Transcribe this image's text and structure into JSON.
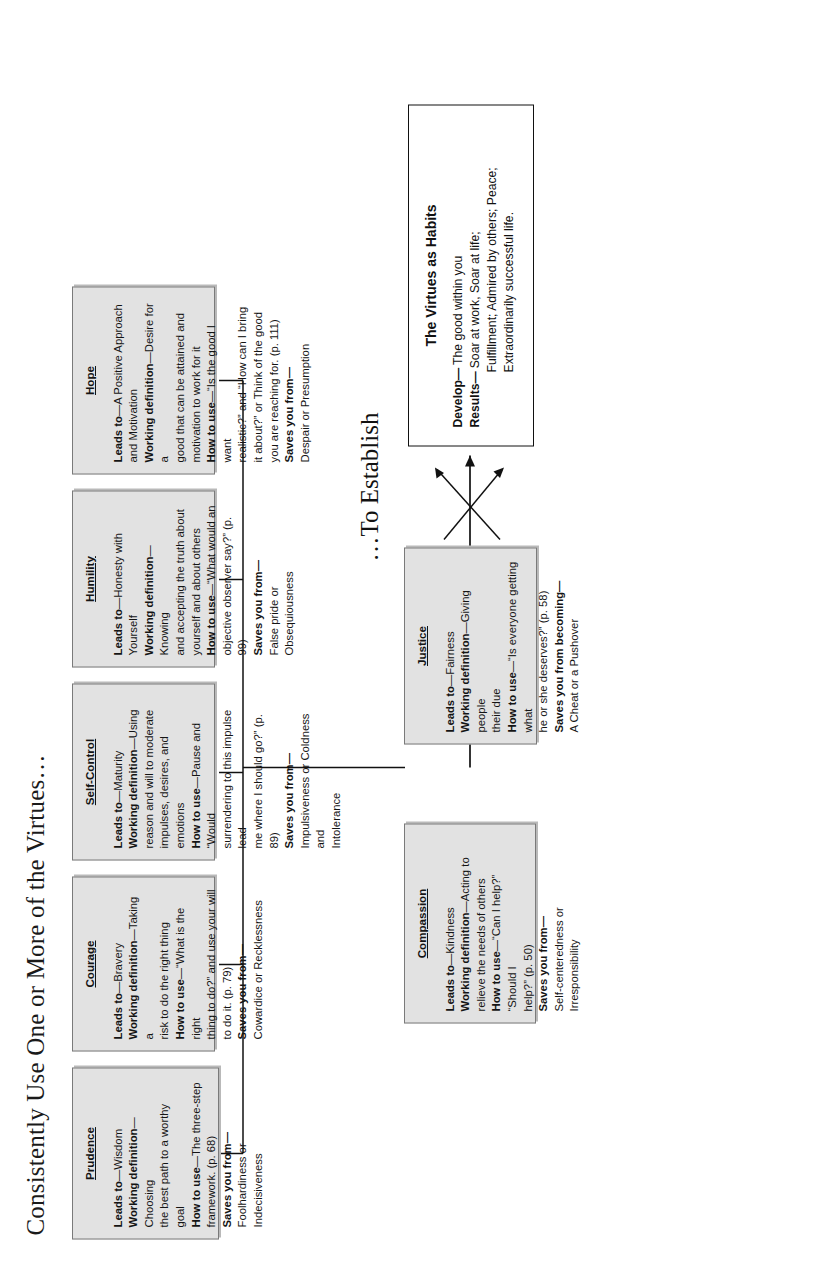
{
  "title": "Consistently Use One or More of the Virtues…",
  "establish_label": "…To Establish",
  "labels": {
    "leads_to": "Leads to",
    "working_definition": "Working definition",
    "how_to_use": "How to use",
    "saves_you_from": "Saves you from—",
    "saves_you_from_becoming": "Saves you from becoming—"
  },
  "virtues": {
    "prudence": {
      "name": "Prudence",
      "l1": "Leads to—Wisdom",
      "l2": "Working definition—Choosing",
      "l3": "the best path to a worthy goal",
      "l4": "How to use—The three-step",
      "l5": "framework. (p. 68)",
      "l6": "Saves you from—",
      "l7": "Foolhardiness or Indecisiveness"
    },
    "courage": {
      "name": "Courage",
      "l1": "Leads to—Bravery",
      "l2": "Working definition—Taking a",
      "l3": "risk to do the right thing",
      "l4": "How to use—“What is the right",
      "l5": "thing to do?” and use your will",
      "l6": "to do it. (p. 79)",
      "l7": "Saves you from—",
      "l8": "Cowardice or Recklessness"
    },
    "self_control": {
      "name": "Self-Control",
      "l1": "Leads to—Maturity",
      "l2": "Working definition—Using",
      "l3": "reason and will to moderate",
      "l4": "impulses, desires, and emotions",
      "l5": "How to use—Pause and “Would",
      "l6": "surrendering to this impulse lead",
      "l7": "me where I should go?” (p. 89)",
      "l8": "Saves you from—",
      "l9": "Impulsiveness or Coldness and",
      "l10": "Intolerance"
    },
    "humility": {
      "name": "Humility",
      "l1": "Leads to—Honesty with Yourself",
      "l2": "Working definition—Knowing",
      "l3": "and accepting the truth about",
      "l4": "yourself and about others",
      "l5": "How to use—“What would an",
      "l6": "objective observer say?” (p. 99)",
      "l7": "Saves you from—",
      "l8": "False pride or Obsequiousness"
    },
    "hope": {
      "name": "Hope",
      "l1": "Leads to—A Positive Approach",
      "l2": "and Motivation",
      "l3": "Working definition—Desire for a",
      "l4": "good that can be attained and",
      "l5": "motivation to work for it",
      "l6": "How to use—“Is the good I want",
      "l7": "realistic?” and “How can I bring",
      "l8": "it about?” or Think of the good",
      "l9": "you are reaching for. (p. 111)",
      "l10": "Saves you from—",
      "l11": "Despair or Presumption"
    },
    "compassion": {
      "name": "Compassion",
      "l1": "Leads to—Kindness",
      "l2": "Working definition—Acting to",
      "l3": "relieve the needs of others",
      "l4": "How to use—“Can I help?” “Should I",
      "l5": "help?” (p. 50)",
      "l6": "Saves you from—",
      "l7": "Self-centeredness or Irresponsibility"
    },
    "justice": {
      "name": "Justice",
      "l1": "Leads to—Fairness",
      "l2": "Working definition—Giving people",
      "l3": "their due",
      "l4": "How to use—“Is everyone getting what",
      "l5": "he or she deserves?” (p. 58)",
      "l6": "Saves you from becoming—",
      "l7": "A Cheat or a Pushover"
    }
  },
  "result": {
    "heading": "The Virtues as Habits",
    "develop_key": "Develop—",
    "develop_value": "The good within you",
    "results_key": "Results—",
    "results_value1": "Soar at work, Soar at life;",
    "results_value2": "Fulfillment; Admired by others; Peace;",
    "results_value3": "Extraordinarily successful life."
  },
  "colors": {
    "box_fill": "#e2e2e2",
    "box_border": "#7a7a7a",
    "result_border": "#111111",
    "text": "#141414",
    "page_bg": "#ffffff"
  }
}
